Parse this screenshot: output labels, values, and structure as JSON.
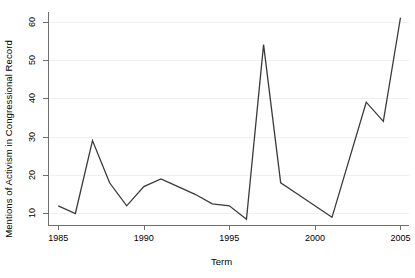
{
  "chart_data": {
    "type": "line",
    "title": "",
    "xlabel": "Term",
    "ylabel": "Mentions of Activism in Congressional Record",
    "xlim": [
      1984.4,
      2005.5
    ],
    "ylim": [
      7.0,
      62.5
    ],
    "xticks": [
      1985,
      1990,
      1995,
      2000,
      2005
    ],
    "xtick_labels": [
      "1985",
      "1990",
      "1995",
      "2000",
      "2005"
    ],
    "yticks": [
      10,
      20,
      30,
      40,
      50,
      60
    ],
    "ytick_labels": [
      "10",
      "20",
      "30",
      "40",
      "50",
      "60"
    ],
    "grid": "horizontal",
    "legend": "none",
    "line_color": "#3a3a3a",
    "background_color": "#ffffff",
    "gridline_color": "#f0f0f0",
    "axis_color": "#6f6f6f",
    "x": [
      1985,
      1986,
      1987,
      1988,
      1989,
      1990,
      1991,
      1992,
      1993,
      1994,
      1995,
      1996,
      1997,
      1998,
      1999,
      2000,
      2001,
      2003,
      2004,
      2005
    ],
    "values": [
      12,
      10,
      29,
      18,
      12,
      17,
      19,
      17,
      15,
      12.5,
      12,
      8.5,
      54,
      18,
      15,
      12,
      9,
      39,
      34,
      61
    ],
    "series": [
      {
        "name": "Mentions of Activism in Congressional Record",
        "points": [
          {
            "x": 1985,
            "y": 12
          },
          {
            "x": 1986,
            "y": 10
          },
          {
            "x": 1987,
            "y": 29
          },
          {
            "x": 1988,
            "y": 18
          },
          {
            "x": 1989,
            "y": 12
          },
          {
            "x": 1990,
            "y": 17
          },
          {
            "x": 1991,
            "y": 19
          },
          {
            "x": 1992,
            "y": 17
          },
          {
            "x": 1993,
            "y": 15
          },
          {
            "x": 1994,
            "y": 12.5
          },
          {
            "x": 1995,
            "y": 12
          },
          {
            "x": 1996,
            "y": 8.5
          },
          {
            "x": 1997,
            "y": 54
          },
          {
            "x": 1998,
            "y": 18
          },
          {
            "x": 1999,
            "y": 15
          },
          {
            "x": 2000,
            "y": 12
          },
          {
            "x": 2001,
            "y": 9
          },
          {
            "x": 2003,
            "y": 39
          },
          {
            "x": 2004,
            "y": 34
          },
          {
            "x": 2005,
            "y": 61
          }
        ]
      }
    ]
  }
}
